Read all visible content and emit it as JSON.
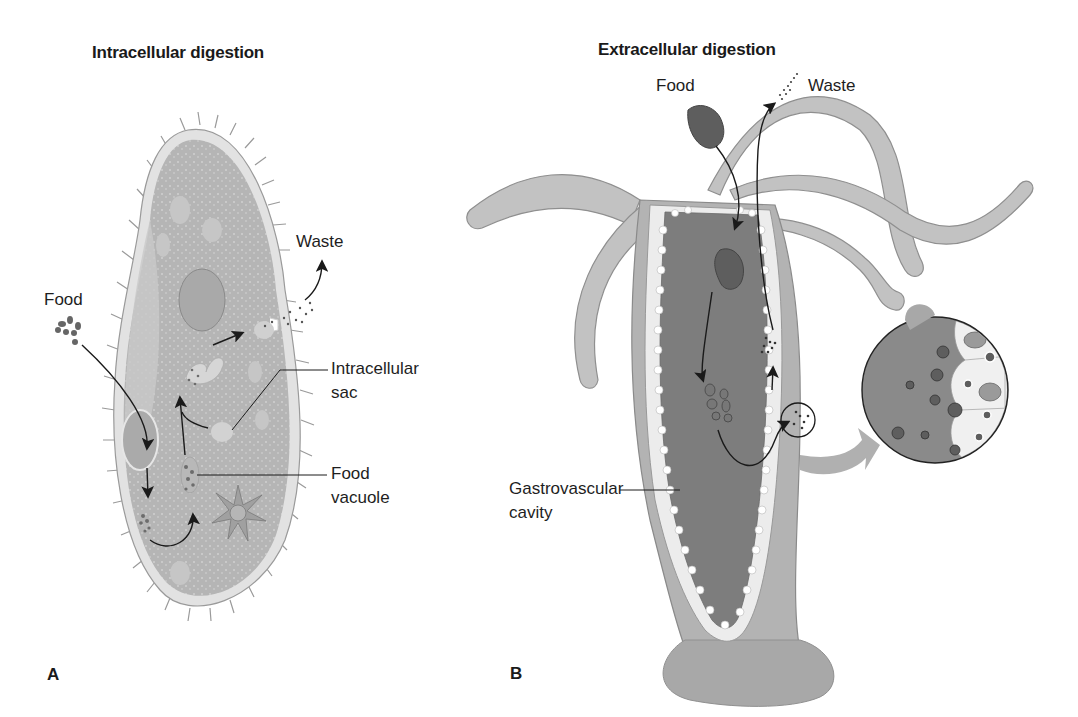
{
  "figure": {
    "panel_a": {
      "letter": "A",
      "title": "Intracellular digestion",
      "organism": "paramecium",
      "labels": {
        "food": "Food",
        "waste": "Waste",
        "intracellular_sac_line1": "Intracellular",
        "intracellular_sac_line2": "sac",
        "food_vacuole_line1": "Food",
        "food_vacuole_line2": "vacuole"
      }
    },
    "panel_b": {
      "letter": "B",
      "title": "Extracellular digestion",
      "organism": "hydra",
      "labels": {
        "food": "Food",
        "waste": "Waste",
        "gastrovascular_line1": "Gastrovascular",
        "gastrovascular_line2": "cavity"
      },
      "inset": "magnified-gastrodermis-cells"
    },
    "colors": {
      "cell_fill": "#b8b8b8",
      "cell_membrane": "#dedede",
      "cavity_fill": "#7d7d7d",
      "tentacle_fill": "#c4c4c4",
      "arrow": "#1a1a1a",
      "particle": "#555555"
    }
  }
}
